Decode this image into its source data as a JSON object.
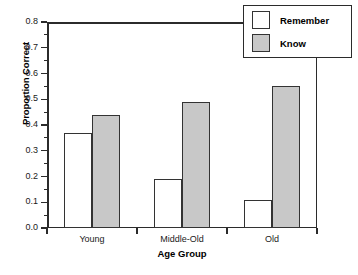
{
  "chart_data": {
    "type": "bar",
    "title": "",
    "xlabel": "Age Group",
    "ylabel": "Proportion Correct",
    "categories": [
      "Young",
      "Middle-Old",
      "Old"
    ],
    "series": [
      {
        "name": "Remember",
        "values": [
          0.37,
          0.19,
          0.11
        ],
        "color": "#ffffff"
      },
      {
        "name": "Know",
        "values": [
          0.44,
          0.49,
          0.55
        ],
        "color": "#c8c8c8"
      }
    ],
    "ylim": [
      0.0,
      0.8
    ],
    "ytick_values": [
      0.0,
      0.1,
      0.2,
      0.3,
      0.4,
      0.5,
      0.6,
      0.7,
      0.8
    ],
    "ytick_labels": [
      "0.0",
      "0.1",
      "0.2",
      "0.3",
      "0.4",
      "0.5",
      "0.6",
      "0.7",
      "0.8"
    ],
    "grid": false,
    "legend_position": "top-right",
    "bar_outline_color": "#333333"
  },
  "legend": {
    "entries": [
      {
        "label": "Remember"
      },
      {
        "label": "Know"
      }
    ]
  },
  "caption": {
    "text": ""
  }
}
